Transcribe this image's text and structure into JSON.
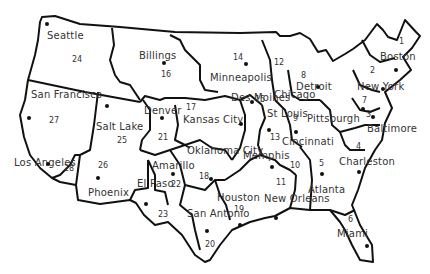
{
  "map": {
    "title": "",
    "regions": [
      {
        "num": "1",
        "city": "Boston",
        "nx": 399,
        "ny": 37,
        "cx": 380,
        "cy": 51,
        "dx": 396,
        "dy": 70
      },
      {
        "num": "2",
        "city": "New York",
        "nx": 370,
        "ny": 66,
        "cx": 357,
        "cy": 81,
        "dx": 383,
        "dy": 89
      },
      {
        "num": "3",
        "city": "Baltimore",
        "nx": 366,
        "ny": 110,
        "cx": 367,
        "cy": 123,
        "dx": 373,
        "dy": 117
      },
      {
        "num": "4",
        "city": "Charleston",
        "nx": 356,
        "ny": 142,
        "cx": 339,
        "cy": 156,
        "dx": 359,
        "dy": 172
      },
      {
        "num": "5",
        "city": "Atlanta",
        "nx": 319,
        "ny": 159,
        "cx": 308,
        "cy": 184,
        "dx": 322,
        "dy": 174
      },
      {
        "num": "6",
        "city": "Miami",
        "nx": 348,
        "ny": 215,
        "cx": 337,
        "cy": 228,
        "dx": 367,
        "dy": 246
      },
      {
        "num": "7",
        "city": "Pittsburgh",
        "nx": 362,
        "ny": 96,
        "cx": 307,
        "cy": 113,
        "dx": 363,
        "dy": 109
      },
      {
        "num": "8",
        "city": "Detroit",
        "nx": 301,
        "ny": 71,
        "cx": 296,
        "cy": 81,
        "dx": 318,
        "dy": 87
      },
      {
        "num": "9",
        "city": "Cincinnati",
        "nx": 293,
        "ny": 114,
        "cx": 282,
        "cy": 136,
        "dx": 296,
        "dy": 132
      },
      {
        "num": "10",
        "city": "Memphis",
        "nx": 290,
        "ny": 161,
        "cx": 243,
        "cy": 150,
        "dx": 272,
        "dy": 167
      },
      {
        "num": "11",
        "city": "New Orleans",
        "nx": 276,
        "ny": 178,
        "cx": 264,
        "cy": 193,
        "dx": 276,
        "dy": 218
      },
      {
        "num": "12",
        "city": "Chicago",
        "nx": 274,
        "ny": 58,
        "cx": 274,
        "cy": 89,
        "dx": 0,
        "dy": 0
      },
      {
        "num": "13",
        "city": "St Louis",
        "nx": 270,
        "ny": 133,
        "cx": 267,
        "cy": 108,
        "dx": 269,
        "dy": 130
      },
      {
        "num": "14",
        "city": "Minneapolis",
        "nx": 233,
        "ny": 53,
        "cx": 210,
        "cy": 72,
        "dx": 246,
        "dy": 64
      },
      {
        "num": "15",
        "city": "Des Moines",
        "nx": 255,
        "ny": 95,
        "cx": 231,
        "cy": 92,
        "dx": 252,
        "dy": 102
      },
      {
        "num": "16",
        "city": "Billings",
        "nx": 161,
        "ny": 70,
        "cx": 139,
        "cy": 50,
        "dx": 164,
        "dy": 63
      },
      {
        "num": "17",
        "city": "Kansas City",
        "nx": 186,
        "ny": 103,
        "cx": 183,
        "cy": 114,
        "dx": 241,
        "dy": 124
      },
      {
        "num": "18",
        "city": "Oklahoma City",
        "nx": 199,
        "ny": 172,
        "cx": 187,
        "cy": 145,
        "dx": 211,
        "dy": 179
      },
      {
        "num": "19",
        "city": "Houston",
        "nx": 234,
        "ny": 205,
        "cx": 217,
        "cy": 192,
        "dx": 240,
        "dy": 225
      },
      {
        "num": "20",
        "city": "San Antonio",
        "nx": 205,
        "ny": 240,
        "cx": 187,
        "cy": 208,
        "dx": 207,
        "dy": 231
      },
      {
        "num": "21",
        "city": "Denver",
        "nx": 158,
        "ny": 133,
        "cx": 144,
        "cy": 105,
        "dx": 162,
        "dy": 118
      },
      {
        "num": "22",
        "city": "Amarillo",
        "nx": 171,
        "ny": 180,
        "cx": 152,
        "cy": 160,
        "dx": 173,
        "dy": 174
      },
      {
        "num": "23",
        "city": "El Paso",
        "nx": 158,
        "ny": 210,
        "cx": 137,
        "cy": 178,
        "dx": 146,
        "dy": 204
      },
      {
        "num": "24",
        "city": "Seattle",
        "nx": 72,
        "ny": 55,
        "cx": 47,
        "cy": 30,
        "dx": 47,
        "dy": 24
      },
      {
        "num": "25",
        "city": "Salt Lake",
        "nx": 117,
        "ny": 136,
        "cx": 96,
        "cy": 121,
        "dx": 107,
        "dy": 106
      },
      {
        "num": "26",
        "city": "Phoenix",
        "nx": 98,
        "ny": 161,
        "cx": 88,
        "cy": 187,
        "dx": 98,
        "dy": 178
      },
      {
        "num": "27",
        "city": "San Francisco",
        "nx": 49,
        "ny": 116,
        "cx": 31,
        "cy": 89,
        "dx": 29,
        "dy": 118
      },
      {
        "num": "28",
        "city": "Los Angeles",
        "nx": 64,
        "ny": 164,
        "cx": 14,
        "cy": 157,
        "dx": 48,
        "dy": 164
      }
    ]
  }
}
